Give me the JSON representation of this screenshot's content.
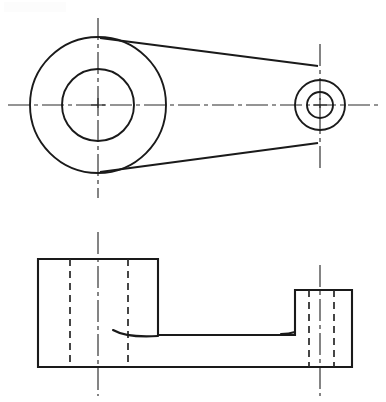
{
  "sheet": {
    "title": "Mechanical Part Orthographic Drawing",
    "width": 386,
    "height": 402,
    "background_color": "#ffffff",
    "line_color": "#1a1a1a",
    "hidden_line_color": "#262626",
    "center_line_color": "#2b2b2b"
  },
  "views": {
    "top": {
      "name": "Top View",
      "label": "",
      "large_boss": {
        "name": "large-boss",
        "center_x": 98,
        "center_y": 105,
        "outer_radius": 68,
        "inner_radius": 36
      },
      "small_boss": {
        "name": "small-boss",
        "center_x": 320,
        "center_y": 105,
        "outer_radius": 25,
        "inner_radius": 13
      },
      "tangent_lines": [
        {
          "name": "upper-tangent",
          "x1": 100,
          "y1": 38,
          "x2": 318,
          "y2": 66
        },
        {
          "name": "lower-tangent",
          "x1": 100,
          "y1": 172,
          "x2": 318,
          "y2": 143
        }
      ],
      "center_lines": {
        "horizontal": {
          "x1": 8,
          "y1": 105,
          "x2": 378,
          "y2": 105
        },
        "vertical_large": {
          "x1": 98,
          "y1": 18,
          "x2": 98,
          "y2": 198
        },
        "vertical_small": {
          "x1": 320,
          "y1": 44,
          "x2": 320,
          "y2": 168
        }
      },
      "center_marks": [
        {
          "name": "large-boss-center-mark",
          "x": 98,
          "y": 105,
          "size": 7
        },
        {
          "name": "small-boss-center-mark",
          "x": 320,
          "y": 105,
          "size": 7
        }
      ]
    },
    "front": {
      "name": "Front View",
      "label": "",
      "left_block": {
        "name": "left-block",
        "x": 38,
        "y": 259,
        "width": 120,
        "height": 108
      },
      "right_block": {
        "name": "right-block",
        "x": 295,
        "y": 290,
        "width": 57,
        "height": 77
      },
      "web": {
        "name": "connecting-web",
        "x": 38,
        "y": 335,
        "width": 314,
        "height": 32
      },
      "hidden_lines": [
        {
          "name": "left-bore-hidden-left",
          "x": 70,
          "y1": 259,
          "y2": 367
        },
        {
          "name": "left-bore-hidden-right",
          "x": 128,
          "y1": 259,
          "y2": 367
        },
        {
          "name": "right-bore-hidden-left",
          "x": 309,
          "y1": 290,
          "y2": 367
        },
        {
          "name": "right-bore-hidden-right",
          "x": 334,
          "y1": 290,
          "y2": 367
        }
      ],
      "fillets": [
        {
          "name": "left-fillet",
          "x1": 113,
          "y1": 330,
          "x2": 158,
          "y2": 336
        },
        {
          "name": "right-fillet",
          "x1": 281,
          "y1": 334,
          "x2": 295,
          "y2": 332
        }
      ],
      "center_lines": {
        "vertical_left": {
          "x1": 98,
          "y1": 232,
          "x2": 98,
          "y2": 396
        },
        "vertical_right": {
          "x1": 320,
          "y1": 265,
          "x2": 320,
          "y2": 396
        }
      }
    }
  }
}
